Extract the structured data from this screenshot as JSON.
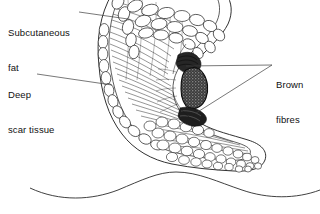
{
  "figure": {
    "background_color": "#ffffff",
    "ink_color": "#1a1a1a",
    "leader_color": "#444444",
    "brown_fibres_color": "#2b2b2b"
  },
  "labels": {
    "subcutaneous_fat": {
      "name": "subcutaneous-fat",
      "line1": "Subcutaneous",
      "line2": "fat"
    },
    "deep_scar_tissue": {
      "name": "deep-scar-tissue",
      "line1": "Deep",
      "line2": "scar tissue"
    },
    "brown_fibres": {
      "name": "brown-fibres",
      "line1": "Brown",
      "line2": "fibres"
    }
  },
  "structures": {
    "fat_lobules": "rounded fat lobule cells forming outer band",
    "scar_tissue": "dense radiating fibrous striations in interior",
    "brown_fibre_mass": "dark stippled mass at the notch",
    "skin_surface": "wavy contour line across lower area"
  }
}
